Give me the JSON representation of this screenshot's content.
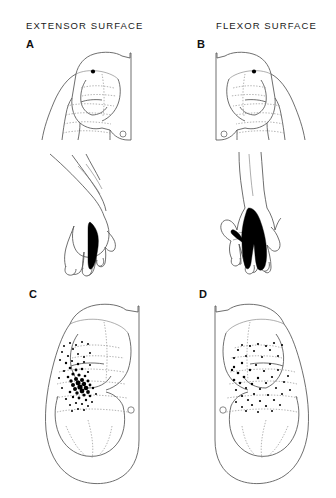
{
  "figure": {
    "background": "#ffffff",
    "ink": "#555555",
    "fill_color": "#000000",
    "width": 336,
    "height": 498
  },
  "headers": [
    {
      "id": "extensor",
      "label": "EXTENSOR SURFACE"
    },
    {
      "id": "flexor",
      "label": "FLEXOR SURFACE"
    }
  ],
  "panels": [
    {
      "id": "A",
      "label": "A",
      "column": "extensor",
      "content": "upper limb, dermatome bands, shoulder dot landmark, olecranon circle, dorsal hand with shaded digit stripe",
      "markers": {
        "filled_dot": "shoulder",
        "open_circle": "olecranon"
      },
      "shaded_region": "single narrow digit stripe"
    },
    {
      "id": "B",
      "label": "B",
      "column": "flexor",
      "content": "upper limb mirrored, dermatome bands, shoulder dot landmark, olecranon circle, palmar hand with large shaded wedge",
      "markers": {
        "filled_dot": "shoulder",
        "open_circle": "olecranon"
      },
      "shaded_region": "large palmar wedge covering palm and two digits"
    },
    {
      "id": "C",
      "label": "C",
      "column": "extensor",
      "content": "limb outline with dermatome bands and stippled point distribution",
      "markers": {
        "open_circle": "olecranon"
      },
      "stipple": {
        "pattern": "dense central cluster",
        "density": "high"
      }
    },
    {
      "id": "D",
      "label": "D",
      "column": "flexor",
      "content": "limb outline with dermatome bands and stippled point distribution",
      "markers": {
        "open_circle": "olecranon"
      },
      "stipple": {
        "pattern": "scattered along band boundaries",
        "density": "low"
      }
    }
  ]
}
